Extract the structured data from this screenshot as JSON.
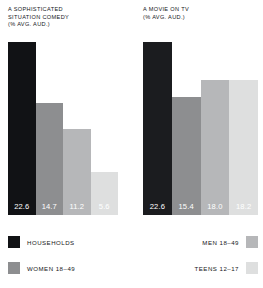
{
  "chart_data": [
    {
      "type": "bar",
      "title": "A SOPHISTICATED SITUATION COMEDY\n(% AVG. AUD.)",
      "title_line1": "A SOPHISTICATED",
      "title_line2": "SITUATION COMEDY",
      "title_line3": "(% AVG. AUD.)",
      "xlabel": "",
      "ylabel": "% AVG. AUD.",
      "ylim": [
        0,
        25
      ],
      "grid": false,
      "categories": [
        "HOUSEHOLDS",
        "WOMEN 18–49",
        "MEN 18–49",
        "TEENS 12–17"
      ],
      "values": [
        22.6,
        14.7,
        11.2,
        5.6
      ],
      "value_labels": [
        "22.6",
        "14.7",
        "11.2",
        "5.6"
      ],
      "colors": [
        "#111215",
        "#8d8e90",
        "#b6b7b9",
        "#dedfdf"
      ]
    },
    {
      "type": "bar",
      "title": "A MOVIE ON TV\n(% AVG. AUD.)",
      "title_line1": "A MOVIE ON TV",
      "title_line2": "(% AVG. AUD.)",
      "title_line3": "",
      "xlabel": "",
      "ylabel": "% AVG. AUD.",
      "ylim": [
        0,
        25
      ],
      "grid": false,
      "categories": [
        "HOUSEHOLDS",
        "WOMEN 18–49",
        "MEN 18–49",
        "TEENS 12–17"
      ],
      "values": [
        22.6,
        15.4,
        18.0,
        18.2
      ],
      "value_labels": [
        "22.6",
        "15.4",
        "18.0",
        "18.2"
      ],
      "colors": [
        "#1b1c1f",
        "#8d8e90",
        "#b6b7b9",
        "#dedfdf"
      ]
    }
  ],
  "panels": {
    "left": {
      "title_line1": "A SOPHISTICATED",
      "title_line2": "SITUATION COMEDY",
      "title_line3": "(% AVG. AUD.)",
      "bars": [
        {
          "label": "HOUSEHOLDS",
          "value": "22.6",
          "height_pct": 100.0,
          "color": "#111215"
        },
        {
          "label": "WOMEN 18–49",
          "value": "14.7",
          "height_pct": 65.0,
          "color": "#8d8e90"
        },
        {
          "label": "MEN 18–49",
          "value": "11.2",
          "height_pct": 49.5,
          "color": "#b6b7b9"
        },
        {
          "label": "TEENS 12–17",
          "value": "5.6",
          "height_pct": 24.8,
          "color": "#dedfdf"
        }
      ]
    },
    "right": {
      "title_line1": "A MOVIE ON TV",
      "title_line2": "(% AVG. AUD.)",
      "title_line3": "",
      "bars": [
        {
          "label": "HOUSEHOLDS",
          "value": "22.6",
          "height_pct": 100.0,
          "color": "#1b1c1f"
        },
        {
          "label": "WOMEN 18–49",
          "value": "15.4",
          "height_pct": 68.2,
          "color": "#8d8e90"
        },
        {
          "label": "MEN 18–49",
          "value": "18.0",
          "height_pct": 78.0,
          "color": "#b6b7b9"
        },
        {
          "label": "TEENS 12–17",
          "value": "18.2",
          "height_pct": 78.0,
          "color": "#dedfdf"
        }
      ]
    }
  },
  "legend": {
    "households": {
      "label": "HOUSEHOLDS",
      "color": "#111215"
    },
    "women": {
      "label": "WOMEN 18–49",
      "color": "#8d8e90"
    },
    "men": {
      "label": "MEN 18–49",
      "color": "#b6b7b9"
    },
    "teens": {
      "label": "TEENS 12–17",
      "color": "#dedfdf"
    }
  }
}
